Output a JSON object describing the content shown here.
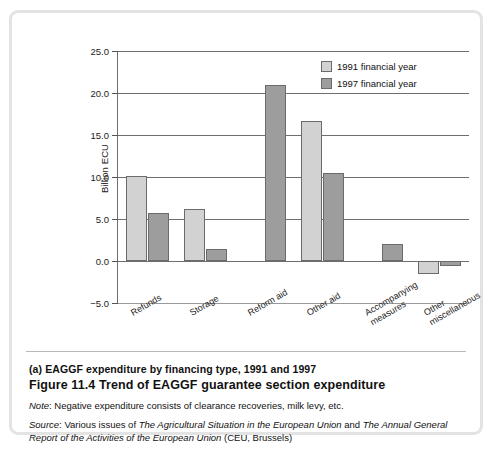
{
  "figure": {
    "panel_label": "(a) EAGGF expenditure by financing type, 1991 and 1997",
    "title": "Figure 11.4  Trend of EAGGF guarantee section expenditure",
    "note_prefix": "Note",
    "note_text": ": Negative expenditure consists of clearance recoveries, milk levy, etc.",
    "source_prefix": "Source",
    "source_part1": ": Various issues of ",
    "source_italic1": "The Agricultural Situation in the European Union",
    "source_part2": " and ",
    "source_italic2": "The Annual General Report of the Activities of the European Union",
    "source_part3": " (CEU, Brussels)"
  },
  "colors": {
    "series_1991": "#d2d2d2",
    "series_1997": "#9d9d9d",
    "axis": "#6e6e6e",
    "frame": "#e3e3e3"
  },
  "chart_data": {
    "type": "bar",
    "title": "(a) EAGGF expenditure by financing type, 1991 and 1997",
    "xlabel": "",
    "ylabel": "Billion ECU",
    "ylim": [
      -5.0,
      25.0
    ],
    "yticks": [
      -5.0,
      0.0,
      5.0,
      10.0,
      15.0,
      20.0,
      25.0
    ],
    "ytick_labels": [
      "−5.0",
      "0.0",
      "5.0",
      "10.0",
      "15.0",
      "20.0",
      "25.0"
    ],
    "grid": true,
    "legend_position": "top-right",
    "categories": [
      "Refunds",
      "Storage",
      "Reform aid",
      "Other aid",
      "Accompanying measures",
      "Other miscellaneous"
    ],
    "category_lines": [
      [
        "Refunds"
      ],
      [
        "Storage"
      ],
      [
        "Reform aid"
      ],
      [
        "Other aid"
      ],
      [
        "Accompanying",
        "measures"
      ],
      [
        "Other",
        "miscellaneous"
      ]
    ],
    "series": [
      {
        "name": "1991 financial year",
        "color": "#d2d2d2",
        "values": [
          10.1,
          6.2,
          0.0,
          16.7,
          0.0,
          -1.5
        ]
      },
      {
        "name": "1997 financial year",
        "color": "#9d9d9d",
        "values": [
          5.7,
          1.4,
          20.9,
          10.5,
          2.0,
          -0.6
        ]
      }
    ]
  }
}
